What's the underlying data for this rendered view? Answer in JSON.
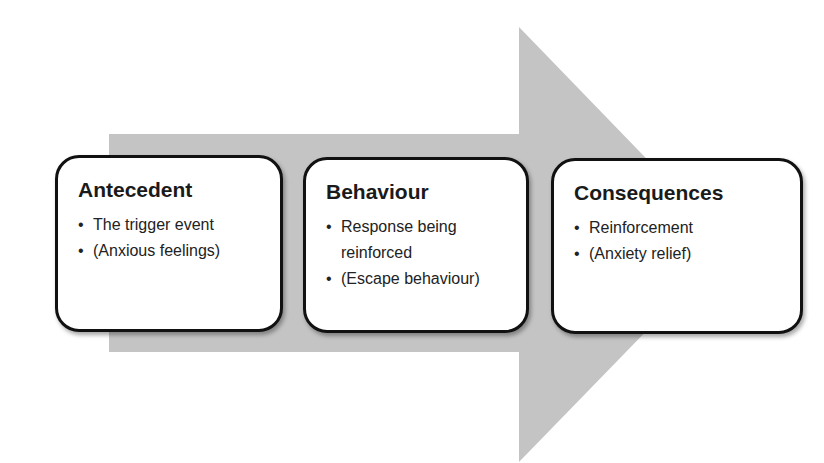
{
  "colors": {
    "arrow_fill": "#c4c4c4",
    "box_border": "#111111",
    "box_fill": "#ffffff",
    "text": "#1a1a1a"
  },
  "diagram": {
    "type": "process-flow",
    "direction": "left-to-right",
    "steps": [
      {
        "title": "Antecedent",
        "bullets": [
          "The trigger event",
          "(Anxious feelings)"
        ]
      },
      {
        "title": "Behaviour",
        "bullets": [
          "Response being reinforced",
          "(Escape behaviour)"
        ]
      },
      {
        "title": "Consequences",
        "bullets": [
          "Reinforcement",
          "(Anxiety relief)"
        ]
      }
    ]
  }
}
